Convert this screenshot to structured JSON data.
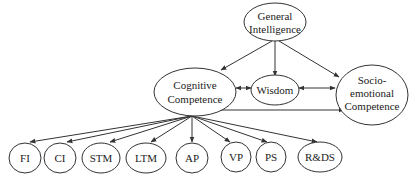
{
  "diagram": {
    "type": "hierarchical-model",
    "nodes": {
      "general_intelligence": {
        "line1": "General",
        "line2": "Intelligence"
      },
      "cognitive_competence": {
        "line1": "Cognitive",
        "line2": "Competence"
      },
      "wisdom": {
        "label": "Wisdom"
      },
      "socio_emotional_competence": {
        "line1": "Socio-",
        "line2": "emotional",
        "line3": "Competence"
      },
      "subcomponents": [
        {
          "label": "FI"
        },
        {
          "label": "CI"
        },
        {
          "label": "STM"
        },
        {
          "label": "LTM"
        },
        {
          "label": "AP"
        },
        {
          "label": "VP"
        },
        {
          "label": "PS"
        },
        {
          "label": "R&DS"
        }
      ]
    },
    "edges": [
      {
        "from": "General Intelligence",
        "to": "Cognitive Competence",
        "type": "directed"
      },
      {
        "from": "General Intelligence",
        "to": "Wisdom",
        "type": "directed"
      },
      {
        "from": "General Intelligence",
        "to": "Socio-emotional Competence",
        "type": "directed"
      },
      {
        "from": "Cognitive Competence",
        "to": "Wisdom",
        "type": "bidirectional"
      },
      {
        "from": "Wisdom",
        "to": "Socio-emotional Competence",
        "type": "bidirectional"
      },
      {
        "from": "Cognitive Competence",
        "to": "Socio-emotional Competence",
        "type": "bidirectional"
      },
      {
        "from": "Cognitive Competence",
        "to": "FI",
        "type": "directed"
      },
      {
        "from": "Cognitive Competence",
        "to": "CI",
        "type": "directed"
      },
      {
        "from": "Cognitive Competence",
        "to": "STM",
        "type": "directed"
      },
      {
        "from": "Cognitive Competence",
        "to": "LTM",
        "type": "directed"
      },
      {
        "from": "Cognitive Competence",
        "to": "AP",
        "type": "directed"
      },
      {
        "from": "Cognitive Competence",
        "to": "VP",
        "type": "directed"
      },
      {
        "from": "Cognitive Competence",
        "to": "PS",
        "type": "directed"
      },
      {
        "from": "Cognitive Competence",
        "to": "R&DS",
        "type": "directed"
      }
    ]
  }
}
